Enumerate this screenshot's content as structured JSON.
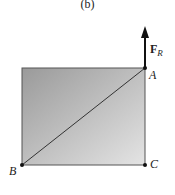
{
  "caption": "(b)",
  "points": {
    "A": {
      "label": "A",
      "x": 145,
      "y": 68
    },
    "B": {
      "label": "B",
      "x": 22,
      "y": 165
    },
    "C": {
      "label": "C",
      "x": 145,
      "y": 165
    }
  },
  "force": {
    "symbol": "F",
    "subscript": "R",
    "direction": "up"
  },
  "colors": {
    "fill_dark": "#9a9a9a",
    "fill_light": "#e2e2e2",
    "line": "#333333"
  }
}
